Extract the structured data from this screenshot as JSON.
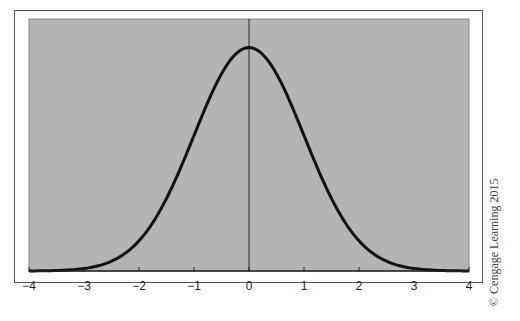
{
  "chart_data": {
    "type": "line",
    "title": "",
    "xlabel": "",
    "ylabel": "",
    "xlim": [
      -4,
      4
    ],
    "ylim": [
      0,
      0.45
    ],
    "grid": false,
    "legend": null,
    "x_ticks": [
      "-4",
      "-3",
      "-2",
      "-1",
      "0",
      "1",
      "2",
      "3",
      "4"
    ],
    "y_ticks": [],
    "series": [
      {
        "name": "Standard normal density",
        "x": [
          -4,
          -3.5,
          -3,
          -2.5,
          -2,
          -1.5,
          -1,
          -0.5,
          0,
          0.5,
          1,
          1.5,
          2,
          2.5,
          3,
          3.5,
          4
        ],
        "values": [
          0.0001,
          0.0009,
          0.0044,
          0.0175,
          0.054,
          0.1295,
          0.242,
          0.3521,
          0.3989,
          0.3521,
          0.242,
          0.1295,
          0.054,
          0.0175,
          0.0044,
          0.0009,
          0.0001
        ]
      }
    ],
    "annotations": [
      "vertical line at x = 0"
    ],
    "colors": {
      "plot_background": "#b4b4b4",
      "curve": "#111111",
      "axis": "#222222"
    }
  },
  "credit": "© Cengage Learning 2015"
}
